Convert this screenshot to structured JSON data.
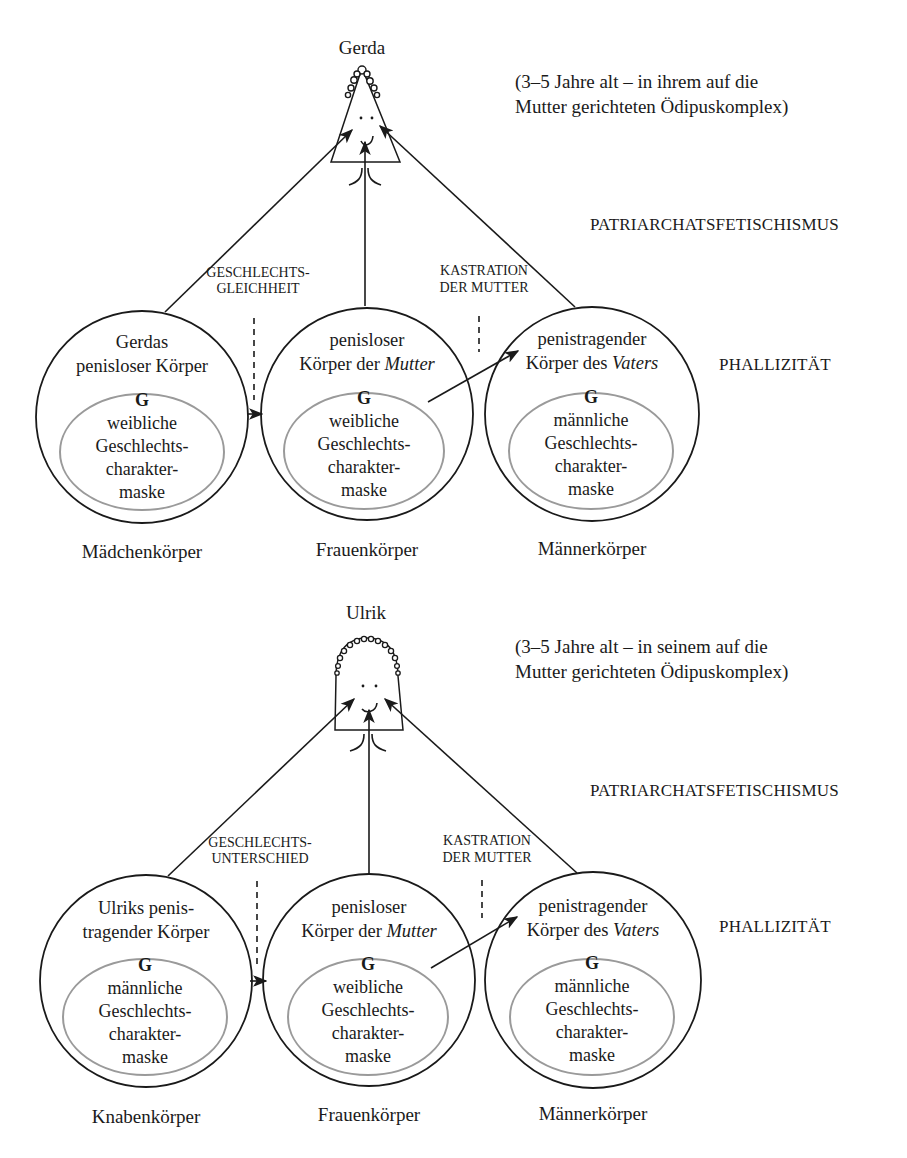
{
  "diagrams": [
    {
      "id": "gerda",
      "child_name": "Gerda",
      "child_shape": "triangle",
      "note_line1": "(3–5 Jahre alt – in ihrem auf die",
      "note_line2": "Mutter gerichteten Ödipuskomplex)",
      "level_top": "PATRIARCHATSFETISCHISMUS",
      "level_bottom": "PHALLIZITÄT",
      "left_relation_line1": "GESCHLECHTS-",
      "left_relation_line2": "GLEICHHEIT",
      "right_relation_line1": "KASTRATION",
      "right_relation_line2": "DER MUTTER",
      "circles": [
        {
          "title_line1": "Gerdas",
          "title_line2": "penisloser Körper",
          "title_line2_prefix": "",
          "title_line2_italic": "",
          "inner_g": "G",
          "inner_line1": "weibliche",
          "inner_line2": "Geschlechts-",
          "inner_line3": "charakter-",
          "inner_line4": "maske",
          "caption": "Mädchenkörper"
        },
        {
          "title_line1": "penisloser",
          "title_line2_prefix": "Körper der ",
          "title_line2_italic": "Mutter",
          "inner_g": "G",
          "inner_line1": "weibliche",
          "inner_line2": "Geschlechts-",
          "inner_line3": "charakter-",
          "inner_line4": "maske",
          "caption": "Frauenkörper"
        },
        {
          "title_line1": "penistragender",
          "title_line2_prefix": "Körper des ",
          "title_line2_italic": "Vaters",
          "inner_g": "G",
          "inner_line1": "männliche",
          "inner_line2": "Geschlechts-",
          "inner_line3": "charakter-",
          "inner_line4": "maske",
          "caption": "Männerkörper"
        }
      ]
    },
    {
      "id": "ulrik",
      "child_name": "Ulrik",
      "child_shape": "dome",
      "note_line1": "(3–5 Jahre alt – in seinem auf die",
      "note_line2": "Mutter gerichteten Ödipuskomplex)",
      "level_top": "PATRIARCHATSFETISCHISMUS",
      "level_bottom": "PHALLIZITÄT",
      "left_relation_line1": "GESCHLECHTS-",
      "left_relation_line2": "UNTERSCHIED",
      "right_relation_line1": "KASTRATION",
      "right_relation_line2": "DER MUTTER",
      "circles": [
        {
          "title_line1": "Ulriks penis-",
          "title_line2": "tragender Körper",
          "inner_g": "G",
          "inner_line1": "männliche",
          "inner_line2": "Geschlechts-",
          "inner_line3": "charakter-",
          "inner_line4": "maske",
          "caption": "Knabenkörper"
        },
        {
          "title_line1": "penisloser",
          "title_line2_prefix": "Körper der ",
          "title_line2_italic": "Mutter",
          "inner_g": "G",
          "inner_line1": "weibliche",
          "inner_line2": "Geschlechts-",
          "inner_line3": "charakter-",
          "inner_line4": "maske",
          "caption": "Frauenkörper"
        },
        {
          "title_line1": "penistragender",
          "title_line2_prefix": "Körper des ",
          "title_line2_italic": "Vaters",
          "inner_g": "G",
          "inner_line1": "männliche",
          "inner_line2": "Geschlechts-",
          "inner_line3": "charakter-",
          "inner_line4": "maske",
          "caption": "Männerkörper"
        }
      ]
    }
  ],
  "colors": {
    "ink": "#1a1a1a",
    "inner_ellipse": "#9a9a9a",
    "background": "#ffffff"
  }
}
